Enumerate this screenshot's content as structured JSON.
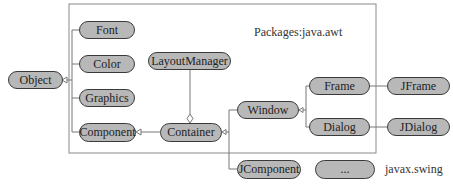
{
  "diagram": {
    "type": "uml-class-hierarchy",
    "packages": {
      "awt_label": "Packages:java.awt",
      "swing_label": "javax.swing"
    },
    "nodes": {
      "object": "Object",
      "font": "Font",
      "color": "Color",
      "graphics": "Graphics",
      "component": "Component",
      "layout_manager": "LayoutManager",
      "container": "Container",
      "window": "Window",
      "frame": "Frame",
      "dialog": "Dialog",
      "jframe": "JFrame",
      "jdialog": "JDialog",
      "jcomponent": "JComponent",
      "ellipsis": "..."
    },
    "edges": [
      {
        "from": "Font",
        "to": "Object",
        "type": "inheritance"
      },
      {
        "from": "Color",
        "to": "Object",
        "type": "inheritance"
      },
      {
        "from": "Graphics",
        "to": "Object",
        "type": "inheritance"
      },
      {
        "from": "Component",
        "to": "Object",
        "type": "inheritance"
      },
      {
        "from": "Container",
        "to": "Component",
        "type": "inheritance"
      },
      {
        "from": "LayoutManager",
        "to": "Container",
        "type": "aggregation"
      },
      {
        "from": "Window",
        "to": "Container",
        "type": "inheritance"
      },
      {
        "from": "JComponent",
        "to": "Container",
        "type": "inheritance"
      },
      {
        "from": "Frame",
        "to": "Window",
        "type": "inheritance"
      },
      {
        "from": "Dialog",
        "to": "Window",
        "type": "inheritance"
      },
      {
        "from": "JFrame",
        "to": "Frame",
        "type": "association"
      },
      {
        "from": "JDialog",
        "to": "Dialog",
        "type": "association"
      }
    ],
    "colors": {
      "node_fill": "#b8b8b8",
      "node_border": "#3a3a3a",
      "line": "#777777"
    }
  }
}
